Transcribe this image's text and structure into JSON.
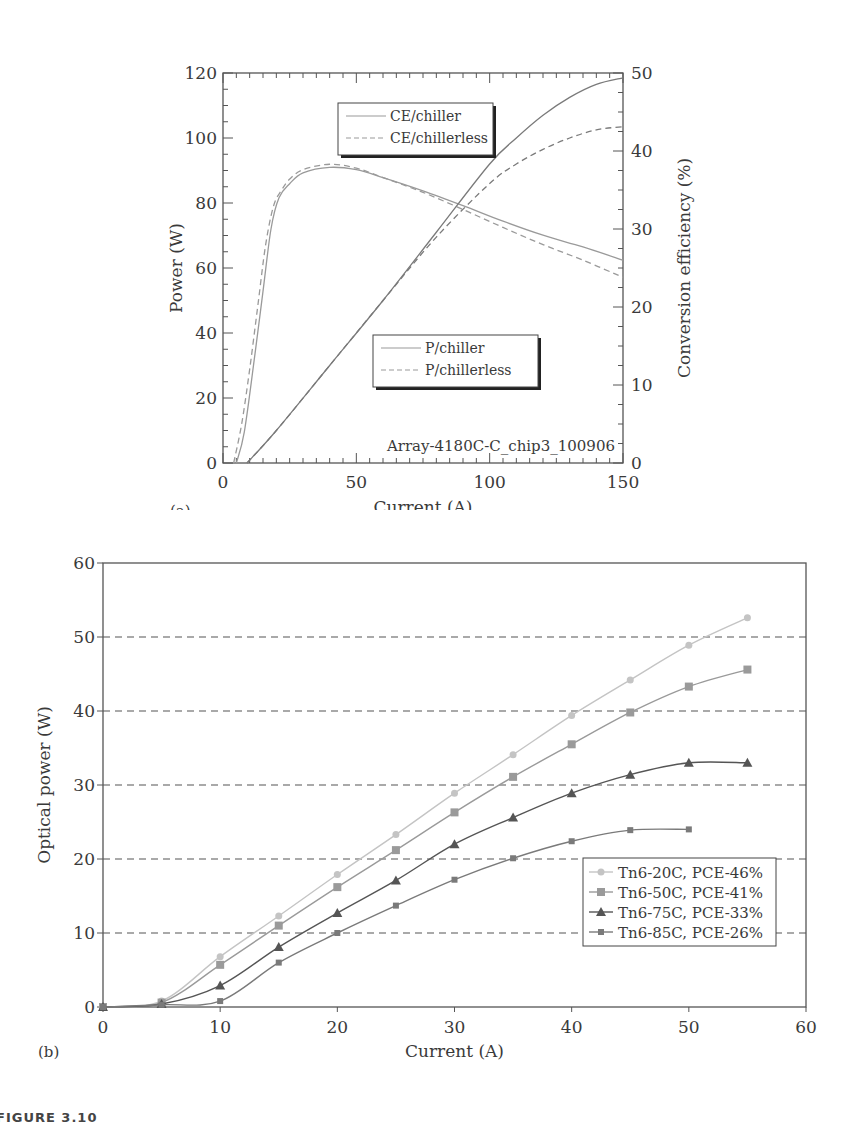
{
  "figure_caption": "FIGURE 3.10",
  "chart_data": [
    {
      "panel": "(a)",
      "type": "line",
      "title": "",
      "xlabel": "Current (A)",
      "ylabel": "Power (W)",
      "y2label": "Conversion efficiency (%)",
      "xlim": [
        0,
        150
      ],
      "ylim": [
        0,
        120
      ],
      "y2lim": [
        0,
        50
      ],
      "xticks": [
        0,
        50,
        100,
        150
      ],
      "yticks": [
        0,
        20,
        40,
        60,
        80,
        100,
        120
      ],
      "y2ticks": [
        0,
        10,
        20,
        30,
        40,
        50
      ],
      "grid": false,
      "annotation": "Array-4180C-C_chip3_100906",
      "legends": [
        {
          "entries": [
            "CE/chiller",
            "CE/chillerless"
          ],
          "position": "upper-center"
        },
        {
          "entries": [
            "P/chiller",
            "P/chillerless"
          ],
          "position": "lower-center"
        }
      ],
      "series": [
        {
          "name": "CE/chiller",
          "axis": "right",
          "style": "solid",
          "color": "#9a9a9a",
          "x": [
            5,
            8,
            12,
            15,
            18,
            21,
            25,
            30,
            40,
            50,
            60,
            75,
            90,
            105,
            120,
            135,
            150
          ],
          "y": [
            0,
            4,
            14,
            22,
            30,
            34,
            35.8,
            37.2,
            37.9,
            37.6,
            36.6,
            34.9,
            33,
            31,
            29.2,
            27.7,
            26
          ]
        },
        {
          "name": "CE/chillerless",
          "axis": "right",
          "style": "dashed",
          "color": "#9a9a9a",
          "x": [
            4,
            7,
            10,
            13,
            16,
            19,
            22,
            25,
            30,
            40,
            50,
            60,
            75,
            90,
            105,
            120,
            135,
            150
          ],
          "y": [
            0,
            5,
            12,
            20,
            28,
            33,
            35,
            36.4,
            37.6,
            38.3,
            37.8,
            36.6,
            34.7,
            32.5,
            30.2,
            28,
            26,
            23.8
          ]
        },
        {
          "name": "P/chiller",
          "axis": "left",
          "style": "solid",
          "color": "#7a7a7a",
          "x": [
            9,
            20,
            40,
            60,
            80,
            100,
            110,
            120,
            130,
            140,
            150
          ],
          "y": [
            0,
            10,
            30,
            50,
            71,
            92,
            100,
            107,
            112.5,
            116.5,
            118.5
          ]
        },
        {
          "name": "P/chillerless",
          "axis": "left",
          "style": "dashed",
          "color": "#7a7a7a",
          "x": [
            9,
            20,
            40,
            60,
            80,
            100,
            110,
            120,
            130,
            140,
            150
          ],
          "y": [
            0,
            10,
            30,
            50,
            69.5,
            86,
            92,
            96.5,
            100,
            102.5,
            103.5
          ]
        }
      ]
    },
    {
      "panel": "(b)",
      "type": "line",
      "title": "",
      "xlabel": "Current (A)",
      "ylabel": "Optical power (W)",
      "xlim": [
        0,
        60
      ],
      "ylim": [
        0,
        60
      ],
      "xticks": [
        0,
        10,
        20,
        30,
        40,
        50,
        60
      ],
      "yticks": [
        0,
        10,
        20,
        30,
        40,
        50,
        60
      ],
      "grid": "horizontal dashed at 10,20,30,40,50",
      "legend_position": "lower-right",
      "series": [
        {
          "name": "Tn6-20C, PCE-46%",
          "marker": "circle",
          "color": "#c4c4c4",
          "x": [
            0,
            5,
            10,
            15,
            20,
            25,
            30,
            35,
            40,
            45,
            50,
            55
          ],
          "y": [
            0,
            0.8,
            6.8,
            12.3,
            17.9,
            23.3,
            28.9,
            34.1,
            39.4,
            44.2,
            48.9,
            52.6
          ]
        },
        {
          "name": "Tn6-50C, PCE-41%",
          "marker": "square",
          "color": "#9a9a9a",
          "x": [
            0,
            5,
            10,
            15,
            20,
            25,
            30,
            35,
            40,
            45,
            50,
            55
          ],
          "y": [
            0,
            0.6,
            5.7,
            11,
            16.2,
            21.2,
            26.3,
            31.1,
            35.5,
            39.8,
            43.3,
            45.6
          ]
        },
        {
          "name": "Tn6-75C, PCE-33%",
          "marker": "triangle",
          "color": "#555555",
          "x": [
            0,
            5,
            10,
            15,
            20,
            25,
            30,
            35,
            40,
            45,
            50,
            55
          ],
          "y": [
            0,
            0.4,
            2.9,
            8.1,
            12.7,
            17.1,
            22,
            25.6,
            28.9,
            31.4,
            33,
            33
          ]
        },
        {
          "name": "Tn6-85C, PCE-26%",
          "marker": "small-square",
          "color": "#7a7a7a",
          "x": [
            0,
            5,
            10,
            15,
            20,
            25,
            30,
            35,
            40,
            45,
            50
          ],
          "y": [
            0,
            0.3,
            0.8,
            6,
            10,
            13.7,
            17.2,
            20.1,
            22.4,
            23.9,
            24
          ]
        }
      ]
    }
  ]
}
